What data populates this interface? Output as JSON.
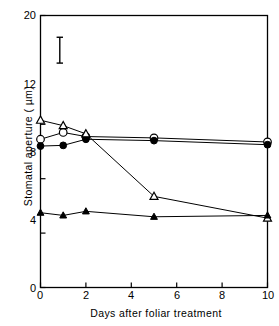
{
  "chart_data": {
    "type": "line",
    "title": "",
    "xlabel": "Days after foliar treatment",
    "ylabel": "Stomatal aperture ( µm)",
    "xlim": [
      0,
      10
    ],
    "ylim": [
      0,
      20
    ],
    "xticks": [
      0,
      2,
      4,
      6,
      8,
      10
    ],
    "xtick_labels": [
      "0",
      "2",
      "4",
      "6",
      "8",
      "10"
    ],
    "yticks": [
      0,
      4,
      8,
      12,
      20
    ],
    "ytick_labels": [
      "0",
      "4",
      "8",
      "12",
      "20"
    ],
    "grid": false,
    "legend": "none",
    "x": [
      0,
      1,
      2,
      5,
      10
    ],
    "series": [
      {
        "name": "open-circle",
        "marker": "open circle",
        "values": [
          10.9,
          11.4,
          11.1,
          11.0,
          10.7
        ]
      },
      {
        "name": "filled-circle",
        "marker": "filled circle",
        "values": [
          10.4,
          10.45,
          10.9,
          10.8,
          10.5
        ]
      },
      {
        "name": "open-triangle",
        "marker": "open triangle",
        "values": [
          12.3,
          11.9,
          11.3,
          6.7,
          5.1
        ]
      },
      {
        "name": "filled-triangle",
        "marker": "filled triangle",
        "values": [
          5.5,
          5.3,
          5.6,
          5.2,
          5.3
        ]
      }
    ],
    "annotations": [
      {
        "name": "error-bar",
        "type": "vertical error bar",
        "x": 0.85,
        "y_top": 18.4,
        "y_bottom": 16.5
      }
    ]
  },
  "axis": {
    "y_label": "Stomatal aperture ( µm)",
    "x_label": "Days after foliar treatment",
    "y_tick_20": "20",
    "y_tick_12": "12",
    "y_tick_8": "8",
    "y_tick_4": "4",
    "y_tick_0": "0",
    "x_tick_0": "0",
    "x_tick_2": "2",
    "x_tick_4": "4",
    "x_tick_6": "6",
    "x_tick_8": "8",
    "x_tick_10": "10"
  },
  "style": {
    "ink": "#000000",
    "paper": "#ffffff"
  }
}
